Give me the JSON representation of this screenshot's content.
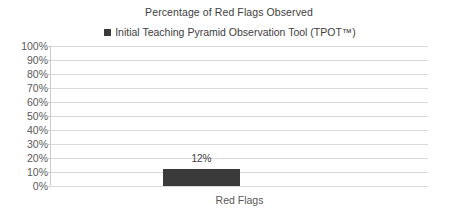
{
  "chart_data": {
    "type": "bar",
    "title": "Percentage of Red Flags Observed",
    "xlabel": "Red Flags",
    "ylabel": "",
    "categories": [
      "Red Flags"
    ],
    "series": [
      {
        "name": "Initial Teaching Pyramid Observation Tool (TPOT™)",
        "values": [
          12
        ],
        "value_labels": [
          "12%"
        ],
        "color": "#3a3a3a"
      }
    ],
    "ylim": [
      0,
      100
    ],
    "y_tick_labels": [
      "100%",
      "90%",
      "80%",
      "70%",
      "60%",
      "50%",
      "40%",
      "30%",
      "20%",
      "10%",
      "0%"
    ],
    "y_tick_values": [
      100,
      90,
      80,
      70,
      60,
      50,
      40,
      30,
      20,
      10,
      0
    ],
    "grid": true,
    "grid_axis": "y",
    "grid_color": "#d9d9d9",
    "legend_position": "top",
    "axis_line_color": "#c9c9c9",
    "text_color": "#404040",
    "tick_label_color": "#595959",
    "background": "#ffffff"
  },
  "legend": {
    "entries": [
      {
        "label": "Initial Teaching Pyramid Observation Tool (TPOT™)",
        "marker": "square-marker",
        "color": "#3a3a3a"
      }
    ]
  }
}
